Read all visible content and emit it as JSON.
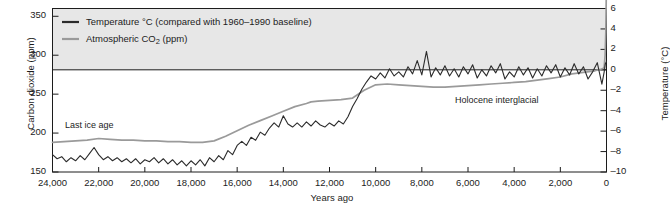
{
  "chart_data": {
    "type": "line",
    "title": "",
    "subtitle": "",
    "xlabel": "Years ago",
    "ylabel": "Carbon dioxide (ppm)",
    "y2label": "Temperature (°C)",
    "xlim": [
      24000,
      0
    ],
    "x_reversed": true,
    "ylim": [
      150,
      360
    ],
    "y2lim": [
      -10,
      6
    ],
    "grid": false,
    "legend_position": "top-left",
    "xticks": [
      "24,000",
      "22,000",
      "20,000",
      "18,000",
      "16,000",
      "14,000",
      "12,000",
      "10,000",
      "8,000",
      "6,000",
      "4,000",
      "2,000",
      "0"
    ],
    "xtick_values": [
      24000,
      22000,
      20000,
      18000,
      16000,
      14000,
      12000,
      10000,
      8000,
      6000,
      4000,
      2000,
      0
    ],
    "yticks": [
      "150",
      "200",
      "250",
      "300",
      "350"
    ],
    "ytick_values": [
      150,
      200,
      250,
      300,
      350
    ],
    "y2ticks": [
      "6",
      "4",
      "2",
      "0",
      "–2",
      "–4",
      "–6",
      "–8",
      "–10"
    ],
    "y2tick_values": [
      6,
      4,
      2,
      0,
      -2,
      -4,
      -6,
      -8,
      -10
    ],
    "baseline_value": 0,
    "baseline_axis": "temperature",
    "legend": [
      {
        "label": "Temperature °C (compared with 1960–1990 baseline)",
        "color": "#2b2b2b",
        "width": 1.6,
        "series": "temperature"
      },
      {
        "label": "Atmospheric CO2 (ppm)",
        "label_prefix": "Atmospheric CO",
        "label_sub": "2",
        "label_suffix": " (ppm)",
        "color": "#9a9a9a",
        "width": 1.8,
        "series": "co2"
      }
    ],
    "annotations": [
      {
        "text": "Last ice age",
        "x": 22200,
        "y_ppm": 207,
        "px": 65,
        "py": 122
      },
      {
        "text": "Holocene interglacial",
        "x": 7200,
        "y_ppm": 243,
        "px": 455,
        "py": 96
      }
    ],
    "series": [
      {
        "name": "Atmospheric CO2 (ppm)",
        "color": "#9a9a9a",
        "axis": "left",
        "unit": "ppm",
        "x": [
          24000,
          23500,
          23000,
          22500,
          22000,
          21500,
          21000,
          20500,
          20000,
          19500,
          19000,
          18500,
          18000,
          17500,
          17000,
          16500,
          16000,
          15500,
          15000,
          14500,
          14000,
          13500,
          13000,
          12800,
          12500,
          12000,
          11500,
          11000,
          10500,
          10000,
          9500,
          9000,
          8500,
          8000,
          7500,
          7000,
          6500,
          6000,
          5500,
          5000,
          4500,
          4000,
          3500,
          3000,
          2500,
          2000,
          1500,
          1000,
          500,
          250,
          150,
          100,
          60,
          30,
          10,
          0
        ],
        "values": [
          188,
          189,
          190,
          191,
          193,
          192,
          191,
          191,
          190,
          190,
          189,
          189,
          188,
          188,
          190,
          196,
          203,
          210,
          216,
          222,
          228,
          234,
          238,
          240,
          241,
          242,
          243,
          245,
          255,
          262,
          263,
          262,
          261,
          260,
          259,
          259,
          260,
          261,
          262,
          263,
          264,
          265,
          266,
          268,
          270,
          272,
          276,
          278,
          280,
          282,
          283,
          285,
          300,
          330,
          375,
          398
        ]
      },
      {
        "name": "Temperature °C (compared with 1960–1990 baseline)",
        "color": "#2b2b2b",
        "axis": "right",
        "unit": "°C",
        "x": [
          24000,
          23800,
          23600,
          23400,
          23200,
          23000,
          22800,
          22600,
          22400,
          22200,
          22000,
          21800,
          21600,
          21400,
          21200,
          21000,
          20800,
          20600,
          20400,
          20200,
          20000,
          19800,
          19600,
          19400,
          19200,
          19000,
          18800,
          18600,
          18400,
          18200,
          18000,
          17800,
          17600,
          17400,
          17200,
          17000,
          16800,
          16600,
          16400,
          16200,
          16000,
          15800,
          15600,
          15400,
          15200,
          15000,
          14800,
          14600,
          14400,
          14200,
          14000,
          13800,
          13600,
          13400,
          13200,
          13000,
          12800,
          12600,
          12400,
          12200,
          12000,
          11800,
          11600,
          11400,
          11200,
          11000,
          10800,
          10600,
          10400,
          10200,
          10000,
          9800,
          9600,
          9400,
          9200,
          9000,
          8800,
          8600,
          8400,
          8200,
          8000,
          7800,
          7600,
          7400,
          7200,
          7000,
          6800,
          6600,
          6400,
          6200,
          6000,
          5800,
          5600,
          5400,
          5200,
          5000,
          4800,
          4600,
          4400,
          4200,
          4000,
          3800,
          3600,
          3400,
          3200,
          3000,
          2800,
          2600,
          2400,
          2200,
          2000,
          1800,
          1600,
          1400,
          1200,
          1000,
          800,
          600,
          400,
          200,
          100,
          50,
          0
        ],
        "values": [
          -8.3,
          -8.7,
          -8.5,
          -9.0,
          -8.6,
          -8.9,
          -8.4,
          -8.8,
          -8.2,
          -7.6,
          -8.3,
          -8.8,
          -8.5,
          -8.9,
          -8.6,
          -9.0,
          -8.7,
          -9.1,
          -8.7,
          -9.2,
          -8.8,
          -9.0,
          -8.6,
          -9.1,
          -8.7,
          -9.2,
          -8.8,
          -9.3,
          -8.9,
          -9.4,
          -8.9,
          -9.3,
          -8.8,
          -9.4,
          -8.6,
          -9.0,
          -8.4,
          -8.8,
          -7.9,
          -8.3,
          -7.4,
          -7.0,
          -7.4,
          -6.6,
          -6.9,
          -6.1,
          -6.4,
          -5.7,
          -5.2,
          -5.6,
          -4.5,
          -5.3,
          -5.6,
          -5.2,
          -5.6,
          -5.1,
          -5.5,
          -5.0,
          -5.4,
          -5.6,
          -5.2,
          -5.5,
          -5.0,
          -5.3,
          -4.6,
          -3.6,
          -2.8,
          -1.9,
          -1.2,
          -0.6,
          -0.9,
          -0.3,
          -0.8,
          0.1,
          -0.6,
          -0.2,
          -0.7,
          0.3,
          -0.4,
          0.9,
          -0.5,
          1.8,
          -0.7,
          0.2,
          -0.5,
          0.4,
          -0.6,
          0.1,
          -0.7,
          0.3,
          -0.4,
          0.5,
          -0.8,
          0.0,
          -0.6,
          0.4,
          -0.3,
          0.6,
          -0.9,
          -0.2,
          -0.7,
          0.3,
          -0.5,
          0.2,
          -0.8,
          0.1,
          -0.6,
          0.4,
          -0.3,
          0.5,
          -0.7,
          0.2,
          -0.5,
          0.6,
          -0.4,
          0.3,
          -0.9,
          -0.2,
          0.7,
          -1.4,
          -0.2,
          0.6,
          0.8
        ]
      }
    ]
  },
  "legend": {
    "temperature_label": "Temperature °C (compared with 1960–1990 baseline)",
    "co2_label_prefix": "Atmospheric CO",
    "co2_label_sub": "2",
    "co2_label_suffix": " (ppm)"
  },
  "axes": {
    "left_title": "Carbon dioxide (ppm)",
    "right_title": "Temperature (°C)",
    "bottom_title": "Years ago"
  },
  "annotations": {
    "last_ice_age": "Last ice age",
    "holocene": "Holocene interglacial"
  },
  "colors": {
    "temperature_line": "#2b2b2b",
    "co2_line": "#9a9a9a",
    "legend_band": "#e6e6e6",
    "axis": "#1c1c1c",
    "background": "#ffffff"
  }
}
